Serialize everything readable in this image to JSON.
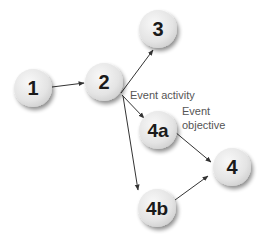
{
  "diagram": {
    "type": "directed-graph",
    "nodes": [
      {
        "id": "1",
        "label": "1",
        "cx": 33,
        "cy": 88
      },
      {
        "id": "2",
        "label": "2",
        "cx": 104,
        "cy": 82
      },
      {
        "id": "3",
        "label": "3",
        "cx": 158,
        "cy": 29
      },
      {
        "id": "4a",
        "label": "4a",
        "cx": 158,
        "cy": 130
      },
      {
        "id": "4b",
        "label": "4b",
        "cx": 157,
        "cy": 208
      },
      {
        "id": "4",
        "label": "4",
        "cx": 232,
        "cy": 167
      }
    ],
    "edges": [
      {
        "from": "1",
        "to": "2"
      },
      {
        "from": "2",
        "to": "3"
      },
      {
        "from": "2",
        "to": "4a"
      },
      {
        "from": "2",
        "to": "4b"
      },
      {
        "from": "4a",
        "to": "4"
      },
      {
        "from": "4b",
        "to": "4"
      }
    ],
    "annotations": {
      "event_activity": "Event activity",
      "event_objective_line1": "Event",
      "event_objective_line2": "objective"
    },
    "colors": {
      "node_fill": "#e6e6e6",
      "node_shadow": "#b5b5b5",
      "edge": "#333333",
      "label": "#1a1a1a",
      "annotation": "#555555"
    }
  }
}
